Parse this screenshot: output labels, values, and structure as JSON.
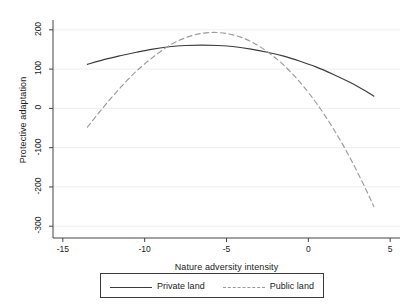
{
  "chart_data": {
    "type": "line",
    "title": "",
    "xlabel": "Nature adversity intensity",
    "ylabel": "Protective adaptation",
    "xlim": [
      -15.6,
      5.6
    ],
    "ylim": [
      -330,
      225
    ],
    "xticks": [
      -15,
      -10,
      -5,
      0,
      5
    ],
    "xtick_labels": [
      "-15",
      "-10",
      "-5",
      "0",
      "5"
    ],
    "yticks": [
      200,
      100,
      0,
      -100,
      -200,
      -300
    ],
    "ytick_labels": [
      "200",
      "100",
      "0",
      "-100",
      "-200",
      "-300"
    ],
    "grid": true,
    "grid_axis": "y",
    "legend_position": "bottom-outside",
    "series": [
      {
        "name": "Private land",
        "style": "solid",
        "color": "#3c3c3c",
        "x": [
          -13.5,
          -12.5,
          -11.5,
          -10.5,
          -9.5,
          -8.5,
          -7.5,
          -6.5,
          -5.5,
          -4.5,
          -3.5,
          -2.5,
          -1.5,
          -0.5,
          0.5,
          1.5,
          2.5,
          3.5,
          4.0
        ],
        "y": [
          112,
          124,
          134,
          143,
          151,
          157,
          160,
          161,
          160,
          157,
          151,
          143,
          133,
          120,
          105,
          87,
          67,
          44,
          31
        ]
      },
      {
        "name": "Public land",
        "style": "dashed",
        "color": "#9a9a9a",
        "x": [
          -13.5,
          -12.5,
          -11.5,
          -10.5,
          -9.5,
          -8.5,
          -7.5,
          -6.5,
          -5.5,
          -4.5,
          -3.5,
          -2.5,
          -1.5,
          -0.5,
          0.5,
          1.5,
          2.5,
          3.5,
          4.0
        ],
        "y": [
          -48,
          4,
          52,
          95,
          130,
          160,
          180,
          191,
          193,
          186,
          170,
          144,
          110,
          66,
          13,
          -50,
          -122,
          -205,
          -250
        ]
      }
    ]
  },
  "legend": {
    "entries": [
      {
        "label": "Private land",
        "style": "solid"
      },
      {
        "label": "Public land",
        "style": "dashed"
      }
    ]
  }
}
